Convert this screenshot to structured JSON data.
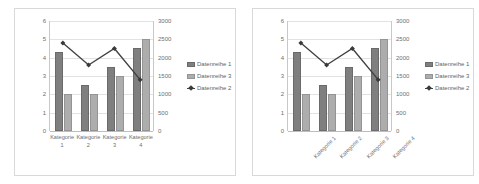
{
  "chart_data": [
    {
      "id": "left",
      "type": "bar",
      "title": "",
      "xlabel": "",
      "ylabel": "",
      "categories": [
        "Kategorie 1",
        "Kategorie 2",
        "Kategorie 3",
        "Kategorie 4"
      ],
      "category_label_rotation": 0,
      "grid": true,
      "legend_position": "right",
      "primary_axis": {
        "ylim": [
          0,
          6
        ],
        "ticks": [
          "0",
          "1",
          "2",
          "3",
          "4",
          "5",
          "6"
        ],
        "tick_values": [
          0,
          1,
          2,
          3,
          4,
          5,
          6
        ]
      },
      "secondary_axis": {
        "ylim": [
          0,
          3000
        ],
        "ticks": [
          "0",
          "500",
          "1000",
          "1500",
          "2000",
          "2500",
          "3000"
        ],
        "tick_values": [
          0,
          500,
          1000,
          1500,
          2000,
          2500,
          3000
        ]
      },
      "series": [
        {
          "name": "Datenreihe 1",
          "type": "bar",
          "axis": "primary",
          "color": "#7f7f7f",
          "values": [
            4.3,
            2.5,
            3.5,
            4.55
          ]
        },
        {
          "name": "Datenreihe 3",
          "type": "bar",
          "axis": "primary",
          "color": "#adadad",
          "values": [
            2.0,
            2.0,
            3.0,
            5.0
          ]
        },
        {
          "name": "Datenreihe 2",
          "type": "line",
          "axis": "secondary",
          "color": "#404040",
          "values": [
            2400,
            1800,
            2250,
            1400
          ]
        }
      ]
    },
    {
      "id": "right",
      "type": "bar",
      "title": "",
      "xlabel": "",
      "ylabel": "",
      "categories": [
        "Kategorie 1",
        "Kategorie 2",
        "Kategorie 3",
        "Kategorie 4"
      ],
      "category_label_rotation": -45,
      "grid": true,
      "legend_position": "right",
      "primary_axis": {
        "ylim": [
          0,
          6
        ],
        "ticks": [
          "0",
          "1",
          "2",
          "3",
          "4",
          "5",
          "6"
        ],
        "tick_values": [
          0,
          1,
          2,
          3,
          4,
          5,
          6
        ]
      },
      "secondary_axis": {
        "ylim": [
          0,
          3000
        ],
        "ticks": [
          "0",
          "500",
          "1000",
          "1500",
          "2000",
          "2500",
          "3000"
        ],
        "tick_values": [
          0,
          500,
          1000,
          1500,
          2000,
          2500,
          3000
        ]
      },
      "series": [
        {
          "name": "Datenreihe 1",
          "type": "bar",
          "axis": "primary",
          "color": "#7f7f7f",
          "values": [
            4.3,
            2.5,
            3.5,
            4.55
          ]
        },
        {
          "name": "Datenreihe 3",
          "type": "bar",
          "axis": "primary",
          "color": "#adadad",
          "values": [
            2.0,
            2.0,
            3.0,
            5.0
          ]
        },
        {
          "name": "Datenreihe 2",
          "type": "line",
          "axis": "secondary",
          "color": "#404040",
          "values": [
            2400,
            1800,
            2250,
            1400
          ]
        }
      ]
    }
  ],
  "colors": {
    "series1": "#7f7f7f",
    "series3": "#adadad",
    "series2_line": "#404040",
    "gridline": "#e2e2e2",
    "axis_text": "#6e6e6e",
    "panel_border": "#d9d9d9",
    "background": "#ffffff"
  }
}
